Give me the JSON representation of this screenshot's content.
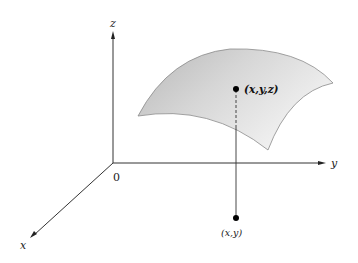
{
  "diagram": {
    "type": "3d-surface-projection",
    "axes": {
      "x_label": "x",
      "y_label": "y",
      "z_label": "z",
      "origin_label": "0"
    },
    "points": {
      "surface_point_label": "(x,y,z)",
      "plane_point_label": "(x,y)"
    },
    "colors": {
      "axis": "#333333",
      "surface_fill_light": "#f2f2f2",
      "surface_fill_dark": "#bdbdbd",
      "surface_edge": "#8a8a8a",
      "point": "#000000"
    }
  }
}
